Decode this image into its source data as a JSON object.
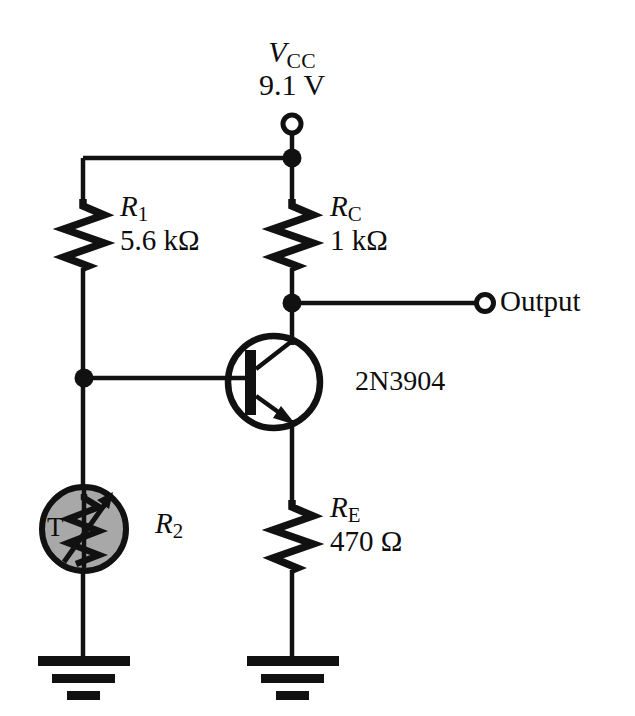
{
  "diagram": {
    "background_color": "#ffffff",
    "line_color": "#111111",
    "thermistor_fill": "#a8a8a8"
  },
  "supply": {
    "name_main": "V",
    "name_sub": "CC",
    "voltage": "9.1 V",
    "terminal": "open-circle"
  },
  "components": {
    "r1": {
      "designator_main": "R",
      "designator_sub": "1",
      "value": "5.6 kΩ",
      "type": "resistor"
    },
    "rc": {
      "designator_main": "R",
      "designator_sub": "C",
      "value": "1 kΩ",
      "type": "resistor"
    },
    "re": {
      "designator_main": "R",
      "designator_sub": "E",
      "value": "470 Ω",
      "type": "resistor"
    },
    "r2": {
      "designator_main": "R",
      "designator_sub": "2",
      "type": "thermistor",
      "marking": "T"
    },
    "transistor": {
      "part_number": "2N3904",
      "type": "npn-bjt"
    }
  },
  "terminals": {
    "output_label": "Output"
  },
  "ground": {
    "symbol": "earth-ground",
    "count": 2
  }
}
